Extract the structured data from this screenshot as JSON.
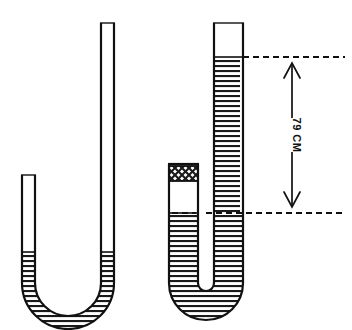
{
  "figure": {
    "background_color": "#ffffff",
    "ink_color": "#111111",
    "liquid_fill_name": "horizontal-hatch",
    "plug_fill_name": "cross-hatch"
  },
  "dimension": {
    "label": "79 CM",
    "arrow_style": "double-headed-vertical",
    "top_reference_name": "upper-dashed-reference-line",
    "bottom_reference_name": "lower-dashed-reference-line"
  },
  "tubes": [
    {
      "name": "left-u-tube",
      "short_arm_label": "open short arm",
      "long_arm_label": "open long arm",
      "liquid_level_short_arm": "equal",
      "liquid_level_long_arm": "equal",
      "sealed": "no",
      "plug_present": "no"
    },
    {
      "name": "right-u-tube",
      "short_arm_label": "closed short arm",
      "long_arm_label": "open long arm",
      "liquid_level_short_arm": "lower",
      "liquid_level_long_arm": "higher",
      "sealed": "yes",
      "plug_present": "yes"
    }
  ]
}
